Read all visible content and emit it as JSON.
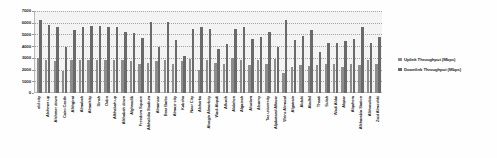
{
  "chart_data": {
    "type": "bar",
    "title": "",
    "xlabel": "",
    "ylabel": "",
    "ylim": [
      0,
      7000
    ],
    "ytick_values": [
      7000,
      6000,
      5000,
      4000,
      3000,
      2000,
      1000,
      0
    ],
    "ytick_labels": [
      "7000",
      "6000",
      "5000",
      "4000",
      "3000",
      "2000",
      "1000",
      "0"
    ],
    "grid": true,
    "legend_position": "right",
    "categories": [
      "old city",
      "Alshmer up",
      "Alshmer down",
      "Cairo Castle",
      "Alkhgirat",
      "Almabah",
      "Almarkity",
      "Sinah",
      "Dabo",
      "Alkhabah up",
      "Alkhabah down",
      "Alghnadib",
      "Freedom Square",
      "Alkhalidia Stadium",
      "Almanzar",
      "Bear Barbs",
      "Almazr city",
      "Kabsha",
      "Nasr City",
      "Alsharka",
      "Alsagin Almarkziy",
      "Wadi Alqadi",
      "Alfuath",
      "Alalahzn",
      "Algazrah",
      "Alsalam",
      "Alsarny",
      "Taz university",
      "Aljabatand Alfasar",
      "Wrinz Almazaf",
      "Algatrain",
      "Aldahi",
      "Aladhil",
      "Thaati",
      "Sufah",
      "Wadi Aldai",
      "Alqaar",
      "Alqahera",
      "Alkharabia Station",
      "Alkhrawbia",
      "Zaid Almoshki"
    ],
    "series": [
      {
        "name": "Uplink Throughput (Mbps)",
        "color": "#8d8d8d",
        "values": [
          3000,
          2850,
          2750,
          1850,
          2800,
          2850,
          2820,
          2830,
          2800,
          2830,
          2780,
          2700,
          2500,
          2600,
          2700,
          2780,
          2450,
          2750,
          2900,
          2000,
          2850,
          2600,
          2450,
          2950,
          2820,
          2350,
          2800,
          2450,
          2900,
          1700,
          2250,
          2400,
          2300,
          2350,
          2500,
          2450,
          2200,
          2500,
          2350,
          2800,
          2450
        ]
      },
      {
        "name": "Downlink Throughput (Mbps)",
        "color": "#6a6a6a",
        "values": [
          6200,
          5800,
          5600,
          3950,
          5400,
          5650,
          5680,
          5700,
          5600,
          5600,
          5250,
          5100,
          4700,
          6050,
          3950,
          6050,
          4500,
          3200,
          5500,
          5600,
          5450,
          3750,
          4150,
          5450,
          5600,
          4600,
          4750,
          5200,
          3900,
          6250,
          4500,
          4900,
          5350,
          3500,
          4300,
          4300,
          4400,
          4600,
          5650,
          4300,
          4800
        ]
      }
    ]
  },
  "legend": {
    "items": [
      {
        "label": "Uplink Throughput (Mbps)",
        "swatch": "up"
      },
      {
        "label": "Downlink Throughput (Mbps)",
        "swatch": "down"
      }
    ]
  }
}
